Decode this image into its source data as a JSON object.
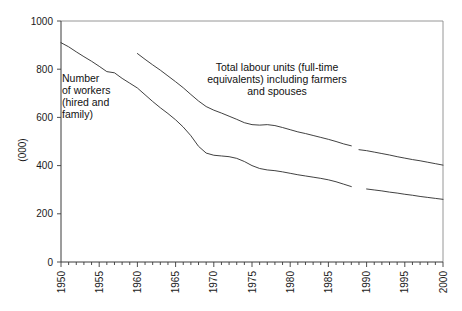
{
  "chart_data": {
    "type": "line",
    "title": "",
    "subtitle": "",
    "xlabel": "",
    "ylabel": "(000)",
    "xlim": [
      1950,
      2000
    ],
    "ylim": [
      0,
      1000
    ],
    "grid": false,
    "legend_position": "inline-annotations",
    "y_ticks": [
      0,
      200,
      400,
      600,
      800,
      1000
    ],
    "y_tick_labels": [
      "0",
      "200",
      "400",
      "600",
      "800",
      "1000"
    ],
    "x_ticks": [
      1950,
      1955,
      1960,
      1965,
      1970,
      1975,
      1980,
      1985,
      1990,
      1995,
      2000
    ],
    "x_tick_labels": [
      "1950",
      "1955",
      "1960",
      "1965",
      "1970",
      "1975",
      "1980",
      "1985",
      "1990",
      "1995",
      "2000"
    ],
    "x_minor_tick_interval": 1,
    "series": [
      {
        "name": "Total labour units (full-time equivalents) including farmers and spouses",
        "color": "#2b2b2b",
        "segments": [
          {
            "x": [
              1960,
              1961,
              1962,
              1963,
              1964,
              1965,
              1966,
              1967,
              1968,
              1969,
              1970,
              1971,
              1972,
              1973,
              1974,
              1975,
              1976,
              1977,
              1978,
              1979,
              1980,
              1981,
              1982,
              1983,
              1984,
              1985,
              1986,
              1987,
              1988
            ],
            "y": [
              865,
              841,
              818,
              796,
              772,
              748,
              723,
              695,
              668,
              645,
              630,
              618,
              605,
              592,
              578,
              570,
              568,
              570,
              566,
              558,
              549,
              540,
              533,
              525,
              517,
              509,
              500,
              490,
              482
            ]
          },
          {
            "x": [
              1989,
              1990,
              1991,
              1992,
              1993,
              1994,
              1995,
              1996,
              1997,
              1998,
              1999,
              2000
            ],
            "y": [
              466,
              462,
              456,
              450,
              444,
              437,
              431,
              425,
              420,
              414,
              408,
              402
            ]
          }
        ]
      },
      {
        "name": "Number of workers (hired and family)",
        "color": "#2b2b2b",
        "segments": [
          {
            "x": [
              1950,
              1951,
              1952,
              1953,
              1954,
              1955,
              1956,
              1957,
              1958,
              1959,
              1960,
              1961,
              1962,
              1963,
              1964,
              1965,
              1966,
              1967,
              1968,
              1969,
              1970,
              1971,
              1972,
              1973,
              1974,
              1975,
              1976,
              1977,
              1978,
              1979,
              1980,
              1981,
              1982,
              1983,
              1984,
              1985,
              1986,
              1987,
              1988
            ],
            "y": [
              910,
              893,
              872,
              852,
              833,
              812,
              790,
              785,
              762,
              742,
              722,
              694,
              666,
              640,
              616,
              590,
              560,
              524,
              480,
              452,
              443,
              440,
              437,
              430,
              417,
              400,
              388,
              382,
              379,
              374,
              368,
              362,
              357,
              352,
              347,
              341,
              333,
              323,
              313
            ]
          },
          {
            "x": [
              1990,
              1991,
              1992,
              1993,
              1994,
              1995,
              1996,
              1997,
              1998,
              1999,
              2000
            ],
            "y": [
              303,
              299,
              295,
              290,
              286,
              281,
              277,
              272,
              268,
              264,
              260
            ]
          }
        ]
      }
    ],
    "annotations": [
      {
        "name": "workers-annotation",
        "lines": [
          "Number",
          "of workers",
          "(hired and",
          "family)"
        ],
        "align": "left",
        "x_px": 62,
        "y_px": 82
      },
      {
        "name": "labour-units-annotation",
        "lines": [
          "Total labour units (full-time",
          "equivalents) including farmers",
          "and spouses"
        ],
        "align": "center",
        "x_px": 277,
        "y_px": 71
      }
    ]
  },
  "plot_geometry": {
    "left_px": 61,
    "right_px": 443,
    "top_px": 21,
    "bottom_px": 262
  }
}
